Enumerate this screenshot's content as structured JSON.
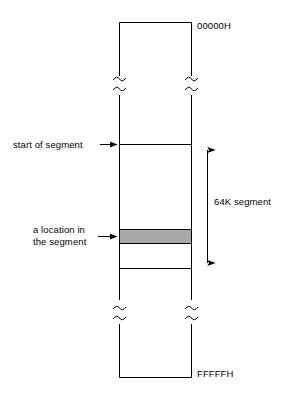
{
  "diagram": {
    "memory_block": {
      "top_address_label": "00000H",
      "bottom_address_label": "FFFFFH",
      "break_marks": "tilde-break"
    },
    "annotations": [
      {
        "id": "start-of-segment",
        "text": "start of segment",
        "points_to": "segment-start-line"
      },
      {
        "id": "segment-size",
        "text": "64K segment",
        "points_to": "segment-extent-arrow"
      },
      {
        "id": "a-location",
        "line1": "a location in",
        "line2": "the segment",
        "points_to": "highlighted-location-band"
      }
    ],
    "colors": {
      "stroke": "#000000",
      "background": "#ffffff",
      "highlight_fill": "#a9a9a9"
    }
  }
}
